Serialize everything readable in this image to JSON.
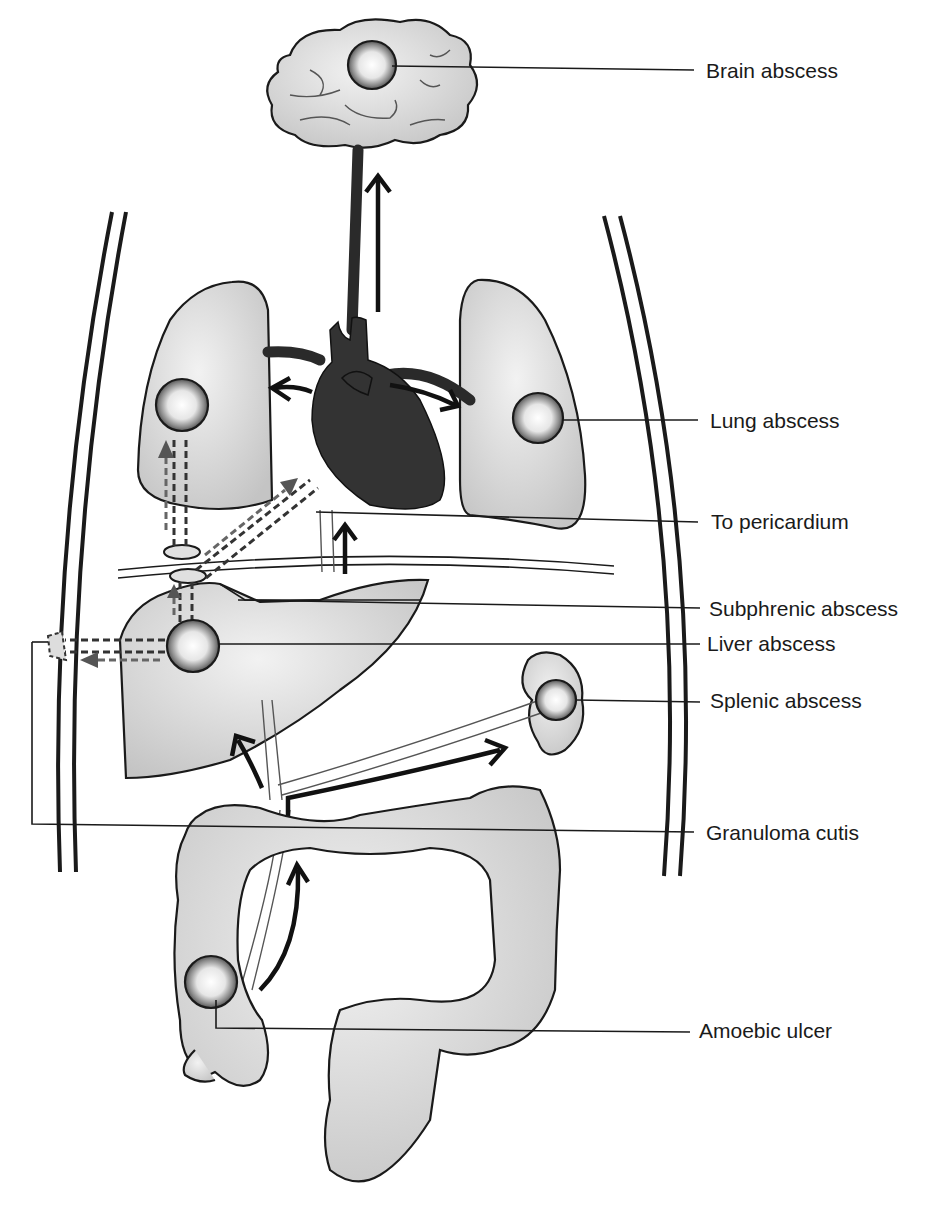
{
  "figure": {
    "type": "anatomical diagram"
  },
  "labels": {
    "brain": "Brain abscess",
    "lung": "Lung abscess",
    "pericardium": "To pericardium",
    "subphrenic": "Subphrenic abscess",
    "liver": "Liver abscess",
    "splenic": "Splenic abscess",
    "granuloma": "Granuloma cutis",
    "ulcer": "Amoebic ulcer"
  },
  "colors": {
    "outline": "#1a1a1a",
    "organ_fill": "#d9d9d9",
    "heart_fill": "#333333",
    "background": "#ffffff"
  }
}
